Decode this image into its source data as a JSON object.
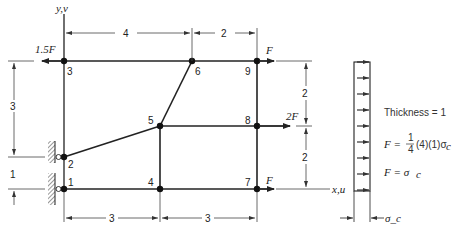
{
  "diagram": {
    "type": "finite-element-mesh",
    "axes": {
      "y_label": "y,v",
      "x_label": "x,u"
    },
    "nodes": [
      {
        "id": "1",
        "label": "1",
        "x": 0,
        "y": 0
      },
      {
        "id": "2",
        "label": "2",
        "x": 0,
        "y": 1
      },
      {
        "id": "3",
        "label": "3",
        "x": 0,
        "y": 4
      },
      {
        "id": "4",
        "label": "4",
        "x": 3,
        "y": 0
      },
      {
        "id": "5",
        "label": "5",
        "x": 3,
        "y": 2
      },
      {
        "id": "6",
        "label": "6",
        "x": 4,
        "y": 4
      },
      {
        "id": "7",
        "label": "7",
        "x": 6,
        "y": 0
      },
      {
        "id": "8",
        "label": "8",
        "x": 6,
        "y": 2
      },
      {
        "id": "9",
        "label": "9",
        "x": 6,
        "y": 4
      }
    ],
    "loads": [
      {
        "node": "3",
        "label": "1.5F",
        "direction": "left"
      },
      {
        "node": "9",
        "label": "F",
        "direction": "right"
      },
      {
        "node": "8",
        "label": "2F",
        "direction": "right"
      },
      {
        "node": "7",
        "label": "F",
        "direction": "right"
      }
    ],
    "dimensions": {
      "top": [
        "4",
        "2"
      ],
      "bottom": [
        "3",
        "3"
      ],
      "left": [
        "3",
        "1"
      ],
      "right": [
        "2",
        "2"
      ]
    },
    "support": "roller-supports at nodes 1 and 2 against hatched wall",
    "stress_block": {
      "label": "σ_c",
      "arrow_count": 9
    },
    "notes": {
      "thickness": "Thickness = 1",
      "f_eq_prefix": "F =",
      "f_eq_num": "1",
      "f_eq_den": "4",
      "f_eq_suffix": "(4)(1)σ",
      "f_eq_sub": "c",
      "f_result_prefix": "F = σ",
      "f_result_sub": "c"
    }
  }
}
